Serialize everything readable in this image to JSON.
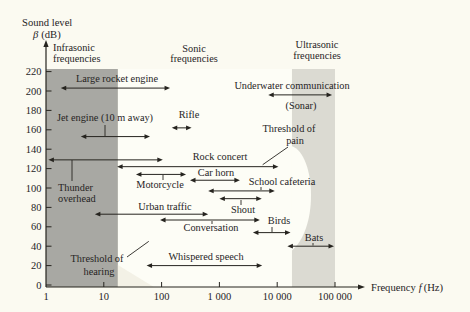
{
  "figure": {
    "y_axis_title_line1": "Sound level",
    "y_axis_title_symbol": "β",
    "y_axis_title_unit": "(dB)",
    "x_axis_title_prefix": "Frequency",
    "x_axis_title_symbol": "f",
    "x_axis_title_unit": "(Hz)"
  },
  "chart_data": {
    "type": "range-annotation chart (horizontal dB-level intervals on log frequency axis)",
    "x_axis": {
      "label": "Frequency f (Hz)",
      "scale": "log",
      "min": 1,
      "max": 100000,
      "tick_values": [
        1,
        10,
        100,
        1000,
        10000,
        100000
      ],
      "tick_labels": [
        "1",
        "10",
        "100",
        "1 000",
        "10 000",
        "100 000"
      ]
    },
    "y_axis": {
      "label": "Sound level β (dB)",
      "min": 0,
      "max": 220,
      "tick_step": 20,
      "tick_values": [
        0,
        20,
        40,
        60,
        80,
        100,
        120,
        140,
        160,
        180,
        200,
        220
      ]
    },
    "regions": [
      {
        "id": "infrasonic",
        "label_lines": [
          "Infrasonic",
          "frequencies"
        ],
        "f_min": 1,
        "f_max": 17.5,
        "fill": "#a8a8a3"
      },
      {
        "id": "sonic",
        "label_lines": [
          "Sonic",
          "frequencies"
        ],
        "f_min": 17.5,
        "f_max": 18000,
        "fill": "#fdfdf6"
      },
      {
        "id": "ultrasonic",
        "label_lines": [
          "Ultrasonic",
          "frequencies"
        ],
        "f_min": 18000,
        "f_max": 100000,
        "fill": "#dbdad2"
      }
    ],
    "items": [
      {
        "id": "large-rocket-engine",
        "label": "Large rocket engine",
        "f_min": 1.8,
        "f_max": 140,
        "db": 203
      },
      {
        "id": "underwater-communication",
        "label": "Underwater communication",
        "sublabel": "(Sonar)",
        "f_min": 7000,
        "f_max": 89000,
        "db": 196
      },
      {
        "id": "jet-engine",
        "label": "Jet engine (10 m away)",
        "f_min": 4,
        "f_max": 63,
        "db": 153
      },
      {
        "id": "rifle",
        "label": "Rifle",
        "f_min": 150,
        "f_max": 330,
        "db": 162
      },
      {
        "id": "thunder-overhead",
        "label_lines": [
          "Thunder",
          "overhead"
        ],
        "f_min": 1.1,
        "f_max": 105,
        "db": 129
      },
      {
        "id": "rock-concert",
        "label": "Rock concert",
        "f_min": 17,
        "f_max": 10500,
        "db": 122
      },
      {
        "id": "motorcycle",
        "label": "Motorcycle",
        "f_min": 36,
        "f_max": 265,
        "db": 114
      },
      {
        "id": "car-horn",
        "label": "Car horn",
        "f_min": 310,
        "f_max": 2260,
        "db": 108
      },
      {
        "id": "school-cafeteria",
        "label": "School cafeteria",
        "f_min": 640,
        "f_max": 9100,
        "db": 97
      },
      {
        "id": "shout",
        "label": "Shout",
        "f_min": 1000,
        "f_max": 5400,
        "db": 89
      },
      {
        "id": "urban-traffic",
        "label": "Urban traffic",
        "f_min": 7,
        "f_max": 640,
        "db": 73
      },
      {
        "id": "conversation",
        "label": "Conversation",
        "f_min": 94,
        "f_max": 5000,
        "db": 67
      },
      {
        "id": "birds",
        "label": "Birds",
        "f_min": 3800,
        "f_max": 17000,
        "db": 54
      },
      {
        "id": "bats",
        "label": "Bats",
        "f_min": 15000,
        "f_max": 96000,
        "db": 40
      },
      {
        "id": "whispered-speech",
        "label": "Whispered speech",
        "f_min": 55,
        "f_max": 5500,
        "db": 20
      }
    ],
    "annotations": [
      {
        "id": "threshold-of-hearing",
        "label_lines": [
          "Threshold of",
          "hearing"
        ],
        "pointer_f": 60,
        "pointer_db": 45
      },
      {
        "id": "threshold-of-pain",
        "label_lines": [
          "Threshold of",
          "pain"
        ],
        "pointer_f": 5600,
        "pointer_db": 124
      }
    ],
    "layout_hints": {
      "legend": "none",
      "grid": "off",
      "ink_color": "#26241f",
      "paper_color": "#fbfaf1"
    }
  }
}
